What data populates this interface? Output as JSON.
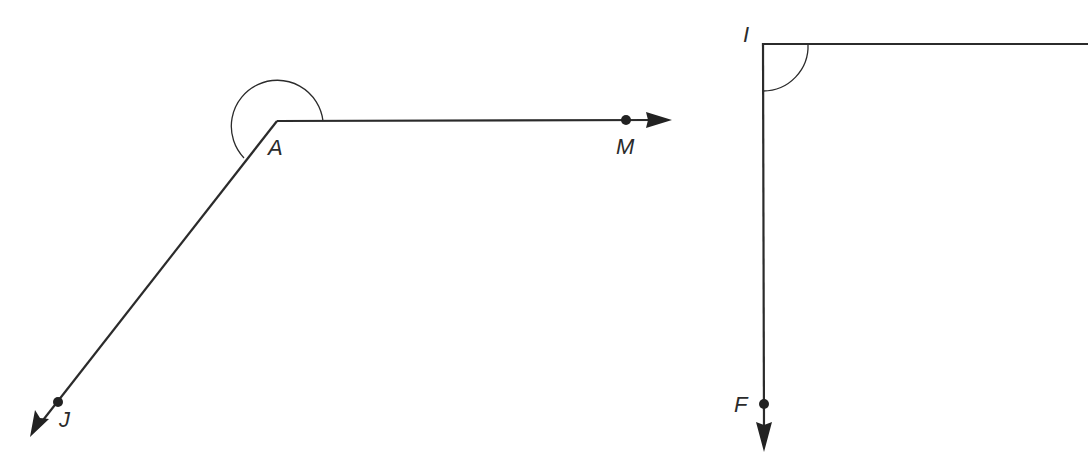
{
  "figures": [
    {
      "name": "angle-JAM",
      "vertex": {
        "label": "A",
        "x": 277,
        "y": 121
      },
      "rays": [
        {
          "label": "M",
          "point": {
            "x": 626,
            "y": 120
          },
          "end": {
            "x": 670,
            "y": 120
          }
        },
        {
          "label": "J",
          "point": {
            "x": 58,
            "y": 402
          },
          "end": {
            "x": 30,
            "y": 437
          }
        }
      ],
      "angle_mark": "reflex arc"
    },
    {
      "name": "angle-FI",
      "vertex": {
        "label": "I",
        "x": 763,
        "y": 44
      },
      "rays": [
        {
          "label": "",
          "end": {
            "x": 1088,
            "y": 44
          }
        },
        {
          "label": "F",
          "point": {
            "x": 764,
            "y": 404
          },
          "end": {
            "x": 764,
            "y": 452
          }
        }
      ],
      "angle_mark": "arc"
    }
  ],
  "labels": {
    "A": "A",
    "M": "M",
    "J": "J",
    "I": "I",
    "F": "F"
  },
  "colors": {
    "stroke": "#2b2b2b",
    "background": "#ffffff"
  }
}
